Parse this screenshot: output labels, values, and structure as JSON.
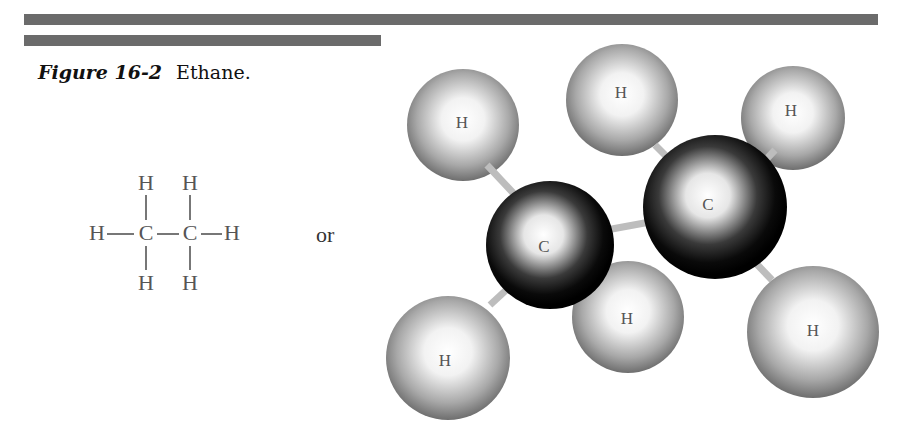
{
  "header": {
    "rules": [
      "long-rule",
      "short-rule"
    ]
  },
  "caption": {
    "figure_label": "Figure 16-2",
    "title": "Ethane."
  },
  "structural_formula": {
    "atoms": {
      "h_top_left": "H",
      "h_top_right": "H",
      "h_left": "H",
      "c_left": "C",
      "c_right": "C",
      "h_right": "H",
      "h_bottom_left": "H",
      "h_bottom_right": "H"
    }
  },
  "connector": "or",
  "ball_and_stick": {
    "atoms": [
      {
        "id": "h-top-left",
        "label": "H",
        "element": "hydrogen"
      },
      {
        "id": "h-top-middle",
        "label": "H",
        "element": "hydrogen"
      },
      {
        "id": "h-top-right",
        "label": "H",
        "element": "hydrogen"
      },
      {
        "id": "c-left",
        "label": "C",
        "element": "carbon"
      },
      {
        "id": "c-right",
        "label": "C",
        "element": "carbon"
      },
      {
        "id": "h-bottom-middle",
        "label": "H",
        "element": "hydrogen"
      },
      {
        "id": "h-bottom-left",
        "label": "H",
        "element": "hydrogen"
      },
      {
        "id": "h-bottom-right",
        "label": "H",
        "element": "hydrogen"
      }
    ]
  },
  "colors": {
    "rule": "#6b6b6b",
    "carbon": "#111111",
    "hydrogen": "#8a8a8a",
    "bond": "#9a9a9a"
  }
}
